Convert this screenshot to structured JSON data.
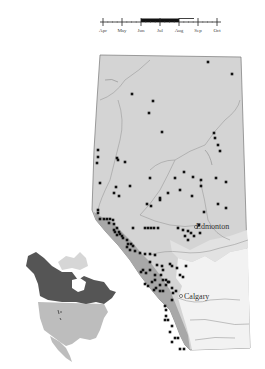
{
  "phenology": {
    "months": [
      "Apr",
      "May",
      "Jun",
      "Jul",
      "Aug",
      "Sep",
      "Oct"
    ],
    "tick_x": [
      103,
      122,
      141,
      160,
      179,
      198,
      217
    ],
    "main_period": {
      "start_x": 141,
      "end_x": 179
    },
    "extended_period": {
      "start_x": 179,
      "end_x": 194
    }
  },
  "map": {
    "title": "Alberta distribution map",
    "colors": {
      "province_fill": "#d4d4d4",
      "mountains_fill": "#a8a8a8",
      "grassland_fill": "#f2f2f2",
      "outline": "#777777",
      "rivers": "#9a9a9a",
      "dot": "#111111",
      "range_dark": "#555555",
      "range_light": "#bdbdbd"
    },
    "cities": [
      {
        "name": "Edmonton",
        "x": 196,
        "y": 227,
        "label_x": 196,
        "label_y": 229
      },
      {
        "name": "Calgary",
        "x": 180,
        "y": 296,
        "label_x": 185,
        "label_y": 298
      }
    ],
    "records": [
      [
        208,
        62
      ],
      [
        232,
        74
      ],
      [
        132,
        94
      ],
      [
        153,
        101
      ],
      [
        149,
        113
      ],
      [
        162,
        132
      ],
      [
        214,
        133
      ],
      [
        215,
        138
      ],
      [
        218,
        145
      ],
      [
        220,
        151
      ],
      [
        98,
        150
      ],
      [
        98,
        157
      ],
      [
        117,
        158
      ],
      [
        118,
        160
      ],
      [
        125,
        162
      ],
      [
        97,
        163
      ],
      [
        216,
        178
      ],
      [
        226,
        182
      ],
      [
        100,
        183
      ],
      [
        116,
        187
      ],
      [
        114,
        193
      ],
      [
        119,
        196
      ],
      [
        130,
        186
      ],
      [
        150,
        178
      ],
      [
        175,
        178
      ],
      [
        184,
        172
      ],
      [
        193,
        177
      ],
      [
        201,
        180
      ],
      [
        201,
        186
      ],
      [
        180,
        190
      ],
      [
        192,
        196
      ],
      [
        147,
        204
      ],
      [
        151,
        206
      ],
      [
        160,
        198
      ],
      [
        160,
        200
      ],
      [
        168,
        193
      ],
      [
        218,
        204
      ],
      [
        226,
        208
      ],
      [
        204,
        212
      ],
      [
        98,
        210
      ],
      [
        98,
        213
      ],
      [
        100,
        219
      ],
      [
        104,
        219
      ],
      [
        107,
        219
      ],
      [
        110,
        219
      ],
      [
        113,
        220
      ],
      [
        109,
        223
      ],
      [
        114,
        224
      ],
      [
        114,
        230
      ],
      [
        117,
        228
      ],
      [
        115,
        232
      ],
      [
        117,
        235
      ],
      [
        120,
        234
      ],
      [
        133,
        228
      ],
      [
        145,
        228
      ],
      [
        148,
        228
      ],
      [
        151,
        228
      ],
      [
        154,
        228
      ],
      [
        158,
        228
      ],
      [
        178,
        228
      ],
      [
        183,
        230
      ],
      [
        188,
        231
      ],
      [
        191,
        233
      ],
      [
        194,
        236
      ],
      [
        200,
        233
      ],
      [
        199,
        225
      ],
      [
        185,
        236
      ],
      [
        188,
        240
      ],
      [
        119,
        232
      ],
      [
        122,
        236
      ],
      [
        123,
        238
      ],
      [
        127,
        240
      ],
      [
        128,
        244
      ],
      [
        131,
        244
      ],
      [
        127,
        247
      ],
      [
        130,
        250
      ],
      [
        133,
        246
      ],
      [
        135,
        251
      ],
      [
        140,
        253
      ],
      [
        145,
        254
      ],
      [
        150,
        254
      ],
      [
        155,
        255
      ],
      [
        150,
        262
      ],
      [
        143,
        270
      ],
      [
        141,
        272
      ],
      [
        146,
        273
      ],
      [
        150,
        270
      ],
      [
        155,
        275
      ],
      [
        155,
        280
      ],
      [
        160,
        285
      ],
      [
        166,
        285
      ],
      [
        162,
        266
      ],
      [
        163,
        270
      ],
      [
        157,
        265
      ],
      [
        170,
        264
      ],
      [
        172,
        266
      ],
      [
        177,
        268
      ],
      [
        186,
        266
      ],
      [
        183,
        277
      ],
      [
        180,
        275
      ],
      [
        161,
        275
      ],
      [
        163,
        280
      ],
      [
        166,
        280
      ],
      [
        168,
        282
      ],
      [
        156,
        288
      ],
      [
        160,
        291
      ],
      [
        163,
        291
      ],
      [
        169,
        282
      ],
      [
        172,
        288
      ],
      [
        176,
        291
      ],
      [
        173,
        293
      ],
      [
        172,
        300
      ],
      [
        145,
        284
      ],
      [
        148,
        286
      ],
      [
        152,
        282
      ],
      [
        154,
        290
      ],
      [
        165,
        306
      ],
      [
        166,
        310
      ],
      [
        166,
        316
      ],
      [
        165,
        320
      ],
      [
        168,
        320
      ],
      [
        172,
        326
      ],
      [
        170,
        332
      ],
      [
        175,
        338
      ],
      [
        178,
        338
      ],
      [
        172,
        342
      ],
      [
        180,
        349
      ],
      [
        184,
        349
      ]
    ],
    "inset_label": "North America range inset"
  }
}
